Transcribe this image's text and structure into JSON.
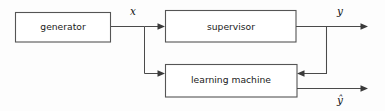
{
  "diagram": {
    "background_color": "#fdfdfd",
    "line_color": "#4a4a4a",
    "box_stroke_color": "#555555",
    "box_fill_color": "#ffffff",
    "text_color": "#1a1a1a",
    "nodes": [
      {
        "id": "generator",
        "label": "generator"
      },
      {
        "id": "supervisor",
        "label": "supervisor"
      },
      {
        "id": "learning_machine",
        "label": "learning machine"
      }
    ],
    "signals": [
      {
        "id": "x",
        "label": "x",
        "description": "input from generator"
      },
      {
        "id": "y",
        "label": "y",
        "description": "supervisor output"
      },
      {
        "id": "y_hat",
        "label": "ŷ",
        "description": "learning machine output"
      }
    ],
    "edges": [
      {
        "from": "generator",
        "to": "supervisor",
        "signal": "x"
      },
      {
        "from": "generator",
        "to": "learning_machine",
        "signal": "x"
      },
      {
        "from": "supervisor",
        "to": "output_y",
        "signal": "y"
      },
      {
        "from": "supervisor",
        "to": "learning_machine",
        "signal": "y"
      },
      {
        "from": "learning_machine",
        "to": "output_y_hat",
        "signal": "ŷ"
      }
    ]
  }
}
